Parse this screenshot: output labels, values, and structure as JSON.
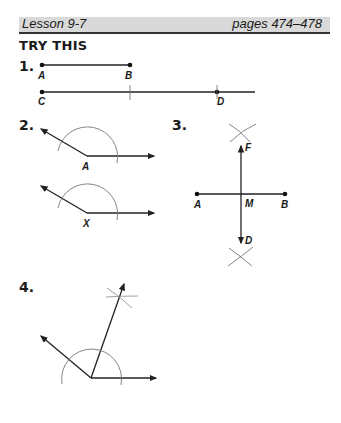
{
  "header": {
    "lesson": "Lesson 9-7",
    "pages": "pages 474–478",
    "bar_color": "#d9d9d9"
  },
  "section": {
    "title": "TRY THIS"
  },
  "problems": [
    {
      "number": "1.",
      "labels": {
        "a": "A",
        "b": "B",
        "c": "C",
        "d": "D"
      }
    },
    {
      "number": "2.",
      "labels": {
        "top_vertex": "A",
        "bottom_vertex": "X"
      }
    },
    {
      "number": "3.",
      "labels": {
        "a": "A",
        "b": "B",
        "m": "M",
        "f": "F",
        "d": "D"
      }
    },
    {
      "number": "4."
    }
  ]
}
